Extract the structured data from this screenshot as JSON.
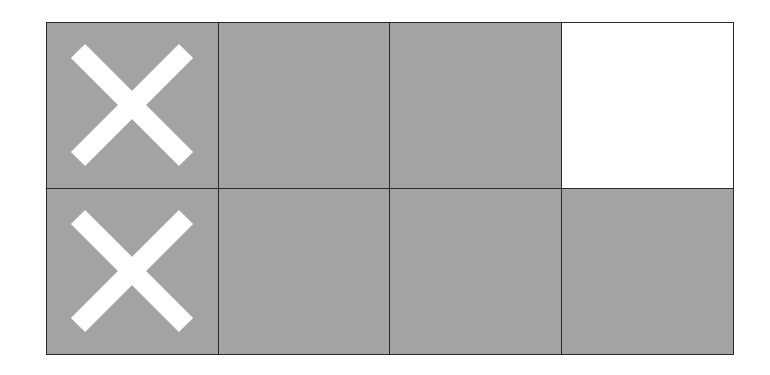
{
  "diagram": {
    "type": "grid",
    "rows": 2,
    "cols": 4,
    "colors": {
      "shaded": "#a3a3a3",
      "unshaded": "#ffffff",
      "border": "#2a2a2a",
      "mark": "#ffffff"
    },
    "cells": [
      {
        "row": 0,
        "col": 0,
        "shaded": true,
        "mark": "x"
      },
      {
        "row": 0,
        "col": 1,
        "shaded": true,
        "mark": ""
      },
      {
        "row": 0,
        "col": 2,
        "shaded": true,
        "mark": ""
      },
      {
        "row": 0,
        "col": 3,
        "shaded": false,
        "mark": ""
      },
      {
        "row": 1,
        "col": 0,
        "shaded": true,
        "mark": "x"
      },
      {
        "row": 1,
        "col": 1,
        "shaded": true,
        "mark": ""
      },
      {
        "row": 1,
        "col": 2,
        "shaded": true,
        "mark": ""
      },
      {
        "row": 1,
        "col": 3,
        "shaded": true,
        "mark": ""
      }
    ],
    "summary": {
      "total_cells": 8,
      "shaded_cells": 7,
      "crossed_out_cells": 2
    }
  }
}
